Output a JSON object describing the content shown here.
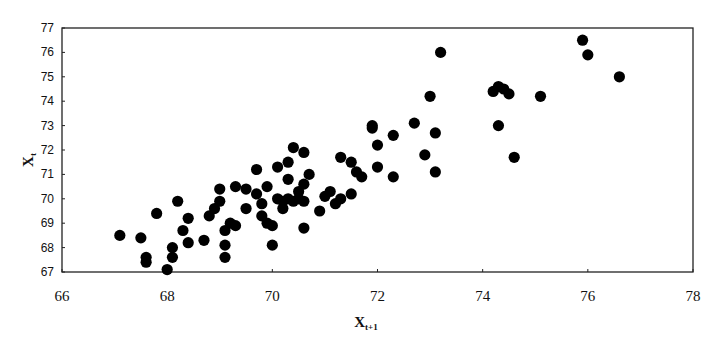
{
  "chart_data": {
    "type": "scatter",
    "title": "",
    "xlabel": "X",
    "xlabel_subscript": "t+1",
    "ylabel": "X",
    "ylabel_subscript": "t",
    "xlim": [
      66,
      78
    ],
    "ylim": [
      67,
      77
    ],
    "xticks": [
      66,
      68,
      70,
      72,
      74,
      76,
      78
    ],
    "yticks": [
      67,
      68,
      69,
      70,
      71,
      72,
      73,
      74,
      75,
      76,
      77
    ],
    "grid": false,
    "legend": null,
    "marker_color": "#000000",
    "points": [
      [
        67.1,
        68.5
      ],
      [
        67.5,
        68.4
      ],
      [
        67.6,
        67.6
      ],
      [
        67.6,
        67.4
      ],
      [
        67.8,
        69.4
      ],
      [
        68.0,
        67.1
      ],
      [
        68.1,
        68.0
      ],
      [
        68.1,
        67.6
      ],
      [
        68.2,
        69.9
      ],
      [
        68.3,
        68.7
      ],
      [
        68.4,
        69.2
      ],
      [
        68.4,
        68.2
      ],
      [
        68.7,
        68.3
      ],
      [
        68.8,
        69.3
      ],
      [
        68.9,
        69.6
      ],
      [
        69.0,
        70.4
      ],
      [
        69.0,
        69.9
      ],
      [
        69.1,
        68.7
      ],
      [
        69.1,
        68.1
      ],
      [
        69.1,
        67.6
      ],
      [
        69.2,
        69.0
      ],
      [
        69.3,
        70.5
      ],
      [
        69.3,
        68.9
      ],
      [
        69.5,
        70.4
      ],
      [
        69.5,
        69.6
      ],
      [
        69.7,
        71.2
      ],
      [
        69.7,
        70.2
      ],
      [
        69.8,
        69.8
      ],
      [
        69.8,
        69.3
      ],
      [
        69.9,
        69.0
      ],
      [
        69.9,
        70.5
      ],
      [
        70.0,
        68.9
      ],
      [
        70.0,
        68.1
      ],
      [
        70.1,
        70.0
      ],
      [
        70.1,
        71.3
      ],
      [
        70.2,
        69.6
      ],
      [
        70.2,
        69.9
      ],
      [
        70.3,
        71.5
      ],
      [
        70.3,
        70.8
      ],
      [
        70.3,
        70.0
      ],
      [
        70.4,
        72.1
      ],
      [
        70.4,
        69.9
      ],
      [
        70.5,
        70.3
      ],
      [
        70.5,
        70.0
      ],
      [
        70.6,
        71.9
      ],
      [
        70.6,
        70.6
      ],
      [
        70.6,
        69.9
      ],
      [
        70.7,
        71.0
      ],
      [
        70.6,
        68.8
      ],
      [
        70.9,
        69.5
      ],
      [
        71.0,
        70.1
      ],
      [
        71.1,
        70.3
      ],
      [
        71.2,
        69.8
      ],
      [
        71.3,
        71.7
      ],
      [
        71.3,
        70.0
      ],
      [
        71.5,
        71.5
      ],
      [
        71.5,
        70.2
      ],
      [
        71.6,
        71.1
      ],
      [
        71.7,
        70.9
      ],
      [
        71.9,
        73.0
      ],
      [
        71.9,
        72.9
      ],
      [
        72.0,
        71.3
      ],
      [
        72.0,
        72.2
      ],
      [
        72.3,
        72.6
      ],
      [
        72.3,
        70.9
      ],
      [
        72.7,
        73.1
      ],
      [
        72.9,
        71.8
      ],
      [
        73.0,
        74.2
      ],
      [
        73.1,
        71.1
      ],
      [
        73.1,
        72.7
      ],
      [
        73.2,
        76.0
      ],
      [
        74.2,
        74.4
      ],
      [
        74.3,
        74.6
      ],
      [
        74.3,
        73.0
      ],
      [
        74.4,
        74.5
      ],
      [
        74.5,
        74.3
      ],
      [
        74.6,
        71.7
      ],
      [
        75.1,
        74.2
      ],
      [
        75.9,
        76.5
      ],
      [
        76.0,
        75.9
      ],
      [
        76.6,
        75.0
      ]
    ]
  },
  "axes": {
    "x_label": "X",
    "x_label_sub": "t+1",
    "y_label": "X",
    "y_label_sub": "t"
  }
}
